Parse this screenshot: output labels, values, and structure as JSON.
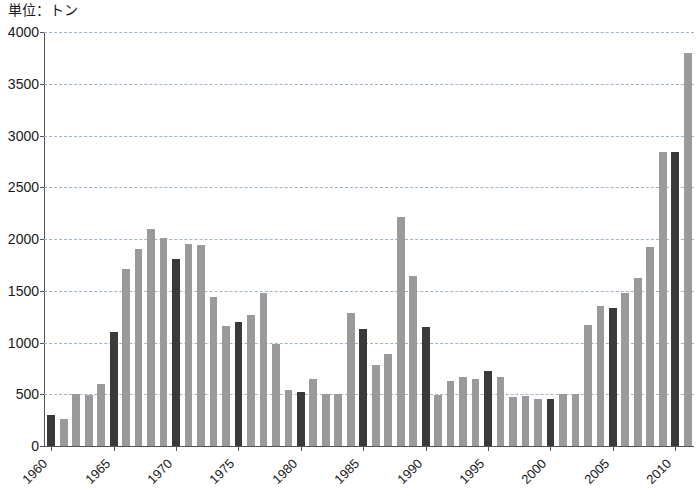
{
  "chart_data": {
    "type": "bar",
    "title": "",
    "unit_caption": "単位：トン",
    "xlabel": "",
    "ylabel": "",
    "ylim": [
      0,
      4000
    ],
    "ytick_step": 500,
    "yticks": [
      0,
      500,
      1000,
      1500,
      2000,
      2500,
      3000,
      3500,
      4000
    ],
    "ytick_labels": [
      "0",
      "500",
      "1000",
      "1500",
      "2000",
      "2500",
      "3000",
      "3500",
      "4000"
    ],
    "grid": true,
    "grid_axis": "y",
    "legend": null,
    "x_tick_labels": [
      "1960",
      "1965",
      "1970",
      "1975",
      "1980",
      "1985",
      "1990",
      "1995",
      "2000",
      "2005",
      "2010"
    ],
    "x_tick_label_rotation": -45,
    "colors": {
      "bar_light": "#9a9a9a",
      "bar_dark": "#3a3a3a",
      "axis": "#555555",
      "grid": "#9fb4c7",
      "background": "#ffffff",
      "text": "#1a1a1a"
    },
    "highlight_rule": "years ending in 0 or 5 drawn dark",
    "categories": [
      "1960",
      "1961",
      "1962",
      "1963",
      "1964",
      "1965",
      "1966",
      "1967",
      "1968",
      "1969",
      "1970",
      "1971",
      "1972",
      "1973",
      "1974",
      "1975",
      "1976",
      "1977",
      "1978",
      "1979",
      "1980",
      "1981",
      "1982",
      "1983",
      "1984",
      "1985",
      "1986",
      "1987",
      "1988",
      "1989",
      "1990",
      "1991",
      "1992",
      "1993",
      "1994",
      "1995",
      "1996",
      "1997",
      "1998",
      "1999",
      "2000",
      "2001",
      "2002",
      "2003",
      "2004",
      "2005",
      "2006",
      "2007",
      "2008",
      "2009",
      "2010",
      "2011"
    ],
    "values": [
      300,
      260,
      505,
      495,
      600,
      1100,
      1710,
      1900,
      2100,
      2010,
      1805,
      1955,
      1945,
      1440,
      1160,
      1200,
      1270,
      1480,
      990,
      545,
      520,
      650,
      500,
      505,
      1290,
      1130,
      780,
      890,
      2215,
      1640,
      1150,
      495,
      630,
      665,
      650,
      720,
      665,
      470,
      480,
      450,
      450,
      500,
      500,
      1165,
      1350,
      1330,
      1480,
      1620,
      1925,
      2840,
      2840,
      3800
    ],
    "series": [
      {
        "name": "数量",
        "values": [
          300,
          260,
          505,
          495,
          600,
          1100,
          1710,
          1900,
          2100,
          2010,
          1805,
          1955,
          1945,
          1440,
          1160,
          1200,
          1270,
          1480,
          990,
          545,
          520,
          650,
          500,
          505,
          1290,
          1130,
          780,
          890,
          2215,
          1640,
          1150,
          495,
          630,
          665,
          650,
          720,
          665,
          470,
          480,
          450,
          450,
          500,
          500,
          1165,
          1350,
          1330,
          1480,
          1620,
          1925,
          2840,
          2840,
          3800
        ]
      }
    ]
  }
}
